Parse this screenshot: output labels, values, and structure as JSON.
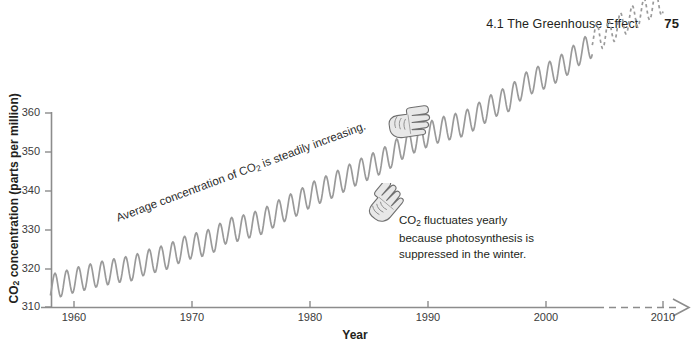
{
  "running_head": {
    "section": "4.1 The Greenhouse Effect",
    "folio": "75"
  },
  "figure": {
    "y_axis_title": "CO2 concentration (parts per million)",
    "x_axis_title": "Year",
    "annotations": {
      "trend": "Average concentration of CO2 is steadily increasing.",
      "fluctuation_line1": "CO2 fluctuates yearly",
      "fluctuation_line2": "because photosynthesis is",
      "fluctuation_line3": "suppressed in the winter."
    },
    "icons": {
      "pointer_upper": "pointing-hand-icon",
      "pointer_lower": "pointing-hand-icon"
    },
    "colors": {
      "curve": "#9a9a9a",
      "axis": "#8c8c8c",
      "text": "#231f20"
    }
  },
  "chart_data": {
    "type": "line",
    "title": "",
    "xlabel": "Year",
    "ylabel": "CO2 concentration (parts per million)",
    "xlim": [
      1957,
      2011
    ],
    "ylim": [
      310,
      363
    ],
    "yticks": [
      310,
      320,
      330,
      340,
      350,
      360
    ],
    "xticks": [
      1960,
      1970,
      1980,
      1990,
      2000,
      2010
    ],
    "grid": false,
    "legend": null,
    "series": [
      {
        "name": "Measured CO2 (Mauna Loa, annual sawtooth)",
        "style": "solid",
        "x_start": 1958,
        "x_end": 2004,
        "description": "Annual sawtooth oscillation superimposed on a rising trend",
        "trend_start_ppm": 315.5,
        "trend_end_ppm": 377.5,
        "seasonal_amplitude_ppm": 3.2,
        "annual_means": [
          {
            "year": 1958,
            "ppm": 315.3
          },
          {
            "year": 1959,
            "ppm": 315.9
          },
          {
            "year": 1960,
            "ppm": 316.9
          },
          {
            "year": 1961,
            "ppm": 317.6
          },
          {
            "year": 1962,
            "ppm": 318.4
          },
          {
            "year": 1963,
            "ppm": 319.0
          },
          {
            "year": 1964,
            "ppm": 319.6
          },
          {
            "year": 1965,
            "ppm": 320.0
          },
          {
            "year": 1966,
            "ppm": 321.4
          },
          {
            "year": 1967,
            "ppm": 322.2
          },
          {
            "year": 1968,
            "ppm": 323.0
          },
          {
            "year": 1969,
            "ppm": 324.6
          },
          {
            "year": 1970,
            "ppm": 325.7
          },
          {
            "year": 1971,
            "ppm": 326.3
          },
          {
            "year": 1972,
            "ppm": 327.5
          },
          {
            "year": 1973,
            "ppm": 329.7
          },
          {
            "year": 1974,
            "ppm": 330.2
          },
          {
            "year": 1975,
            "ppm": 331.1
          },
          {
            "year": 1976,
            "ppm": 332.0
          },
          {
            "year": 1977,
            "ppm": 333.8
          },
          {
            "year": 1978,
            "ppm": 335.4
          },
          {
            "year": 1979,
            "ppm": 336.8
          },
          {
            "year": 1980,
            "ppm": 338.7
          },
          {
            "year": 1981,
            "ppm": 340.1
          },
          {
            "year": 1982,
            "ppm": 341.4
          },
          {
            "year": 1983,
            "ppm": 343.0
          },
          {
            "year": 1984,
            "ppm": 344.6
          },
          {
            "year": 1985,
            "ppm": 346.0
          },
          {
            "year": 1986,
            "ppm": 347.4
          },
          {
            "year": 1987,
            "ppm": 349.2
          },
          {
            "year": 1988,
            "ppm": 351.6
          },
          {
            "year": 1989,
            "ppm": 353.1
          },
          {
            "year": 1990,
            "ppm": 354.4
          },
          {
            "year": 1991,
            "ppm": 355.6
          },
          {
            "year": 1992,
            "ppm": 356.4
          },
          {
            "year": 1993,
            "ppm": 357.1
          },
          {
            "year": 1994,
            "ppm": 358.8
          },
          {
            "year": 1995,
            "ppm": 360.8
          },
          {
            "year": 1996,
            "ppm": 362.6
          },
          {
            "year": 1997,
            "ppm": 363.7
          },
          {
            "year": 1998,
            "ppm": 366.7
          },
          {
            "year": 1999,
            "ppm": 368.4
          },
          {
            "year": 2000,
            "ppm": 369.5
          },
          {
            "year": 2001,
            "ppm": 371.1
          },
          {
            "year": 2002,
            "ppm": 373.2
          },
          {
            "year": 2003,
            "ppm": 375.8
          },
          {
            "year": 2004,
            "ppm": 377.5
          }
        ]
      },
      {
        "name": "Projected CO2",
        "style": "dashed",
        "x_start": 2004,
        "x_end": 2010,
        "trend_start_ppm": 377.5,
        "trend_end_ppm": 388.5,
        "seasonal_amplitude_ppm": 3.2,
        "annual_means": [
          {
            "year": 2005,
            "ppm": 379.8
          },
          {
            "year": 2006,
            "ppm": 381.9
          },
          {
            "year": 2007,
            "ppm": 383.8
          },
          {
            "year": 2008,
            "ppm": 385.6
          },
          {
            "year": 2009,
            "ppm": 387.4
          },
          {
            "year": 2010,
            "ppm": 388.5
          }
        ]
      }
    ],
    "x_axis_extension": {
      "style": "dashed",
      "from": 2004,
      "to": 2011,
      "arrowhead": true
    }
  }
}
